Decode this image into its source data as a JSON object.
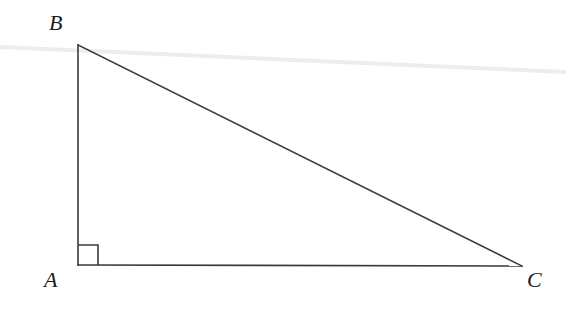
{
  "figure": {
    "background_color": "#ffffff",
    "stroke_color": "#3a3a3a",
    "stroke_width": 1.6,
    "artifact_color": "#ededed",
    "label_color": "#1b1b1b",
    "vertices": [
      {
        "name": "A",
        "label": "A",
        "x": 78,
        "y": 265,
        "label_x": 44,
        "label_y": 269
      },
      {
        "name": "B",
        "label": "B",
        "x": 78,
        "y": 45,
        "label_x": 49,
        "label_y": 12
      },
      {
        "name": "C",
        "label": "C",
        "x": 522,
        "y": 266,
        "label_x": 527,
        "label_y": 269
      }
    ],
    "edges": [
      {
        "name": "leg-AB",
        "from": "A",
        "to": "B",
        "x1": 78,
        "y1": 265,
        "x2": 78,
        "y2": 45
      },
      {
        "name": "hypotenuse-BC",
        "from": "B",
        "to": "C",
        "x1": 78,
        "y1": 45,
        "x2": 522,
        "y2": 266
      },
      {
        "name": "leg-AC",
        "from": "A",
        "to": "C",
        "x1": 78,
        "y1": 265,
        "x2": 522,
        "y2": 266
      }
    ],
    "right_angle_marker": {
      "at_vertex": "A",
      "size": 20,
      "points": "98,265 98,245 78,245"
    },
    "scan_artifact_line": {
      "name": "scan-streak",
      "x1": 0,
      "y1": 47,
      "x2": 566,
      "y2": 72,
      "color": "#ededed",
      "width": 4
    }
  }
}
